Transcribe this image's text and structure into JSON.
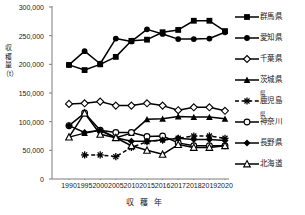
{
  "chart_data": {
    "type": "line",
    "title": "",
    "xlabel": "収 穫 年",
    "ylabel": "収穫量（t）",
    "x": [
      1990,
      1995,
      2000,
      2005,
      2010,
      2015,
      2016,
      2017,
      2018,
      2019,
      2020
    ],
    "xticklabels": [
      "1990",
      "1995",
      "2000",
      "2005",
      "2010",
      "2015",
      "2016",
      "2017",
      "2018",
      "2019",
      "2020"
    ],
    "ylim": [
      0,
      300000
    ],
    "yticks": [
      0,
      50000,
      100000,
      150000,
      200000,
      250000,
      300000
    ],
    "yticklabels": [
      "0",
      "50,000",
      "100,000",
      "150,000",
      "200,000",
      "250,000",
      "300,000"
    ],
    "grid": false,
    "legend_position": "right",
    "series": [
      {
        "name": "群馬県",
        "marker": "filled-square",
        "linestyle": "solid",
        "color": "#000000",
        "values": [
          199000,
          190000,
          200000,
          213000,
          241000,
          243000,
          256000,
          260000,
          276000,
          276000,
          258000
        ]
      },
      {
        "name": "愛知県",
        "marker": "filled-circle",
        "linestyle": "solid",
        "color": "#000000",
        "values": [
          199000,
          223000,
          201000,
          245000,
          240000,
          261000,
          253000,
          244000,
          244000,
          245000,
          256000
        ]
      },
      {
        "name": "千葉県",
        "marker": "open-diamond",
        "linestyle": "solid",
        "color": "#000000",
        "values": [
          131000,
          132000,
          135000,
          128000,
          128000,
          132000,
          128000,
          120000,
          125000,
          125000,
          119000
        ]
      },
      {
        "name": "茨城県",
        "marker": "filled-triangle",
        "linestyle": "solid",
        "color": "#000000",
        "values": [
          73000,
          80000,
          85000,
          72000,
          80000,
          104000,
          105000,
          109000,
          108000,
          108000,
          105000
        ]
      },
      {
        "name": "鹿児島県",
        "marker": "asterisk",
        "linestyle": "dashed",
        "color": "#000000",
        "values": [
          null,
          42000,
          42000,
          39000,
          55000,
          65000,
          68000,
          71000,
          75000,
          75000,
          71000
        ]
      },
      {
        "name": "神奈川県",
        "marker": "open-circle",
        "linestyle": "solid",
        "color": "#000000",
        "values": [
          93000,
          115000,
          85000,
          81000,
          81000,
          74000,
          75000,
          63000,
          58000,
          58000,
          58000
        ]
      },
      {
        "name": "長野県",
        "marker": "filled-diamond",
        "linestyle": "solid",
        "color": "#000000",
        "values": [
          93000,
          81000,
          85000,
          72000,
          66000,
          66000,
          68000,
          71000,
          69000,
          69000,
          67000
        ]
      },
      {
        "name": "北海道",
        "marker": "open-triangle",
        "linestyle": "solid",
        "color": "#000000",
        "values": [
          73000,
          115000,
          78000,
          72000,
          58000,
          50000,
          43000,
          60000,
          55000,
          55000,
          58000
        ]
      }
    ]
  },
  "legend": {
    "items": [
      {
        "label": "群馬県",
        "sup": "",
        "base": "群馬県"
      },
      {
        "label": "愛知県",
        "sup": "",
        "base": "愛知県"
      },
      {
        "label": "千葉県",
        "sup": "",
        "base": "千葉県"
      },
      {
        "label": "茨城県",
        "sup": "",
        "base": "茨城県"
      },
      {
        "label": "鹿児島県",
        "sup": "県",
        "base": "鹿児島"
      },
      {
        "label": "神奈川県",
        "sup": "県",
        "base": "神奈川"
      },
      {
        "label": "長野県",
        "sup": "",
        "base": "長野県"
      },
      {
        "label": "北海道",
        "sup": "",
        "base": "北海道"
      }
    ]
  }
}
